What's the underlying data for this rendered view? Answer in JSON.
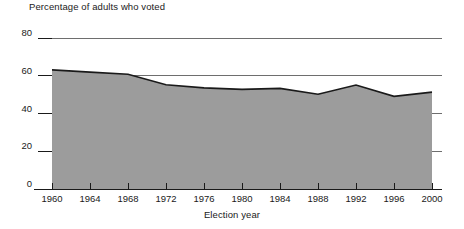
{
  "chart_data": {
    "type": "area",
    "title": "Percentage of adults who voted",
    "xlabel": "Election year",
    "ylabel": "",
    "x": [
      1960,
      1964,
      1968,
      1972,
      1976,
      1980,
      1984,
      1988,
      1992,
      1996,
      2000
    ],
    "values": [
      63.1,
      61.9,
      60.8,
      55.2,
      53.6,
      52.8,
      53.3,
      50.2,
      55.1,
      49.1,
      51.3
    ],
    "categories": [
      "1960",
      "1964",
      "1968",
      "1972",
      "1976",
      "1980",
      "1984",
      "1988",
      "1992",
      "1996",
      "2000"
    ],
    "xtick_labels": [
      "1960",
      "1964",
      "1968",
      "1972",
      "1976",
      "1980",
      "1984",
      "1988",
      "1992",
      "1996",
      "2000"
    ],
    "ytick_labels": [
      "0",
      "20",
      "40",
      "60",
      "80"
    ],
    "yticks": [
      0,
      20,
      40,
      60,
      80
    ],
    "ylim": [
      0,
      80
    ],
    "xlim": [
      1960,
      2000
    ],
    "grid": true,
    "legend": false,
    "series_name": "Percentage of adults who voted",
    "area_color": "#9c9c9c",
    "line_color": "#1a1a1a",
    "axis_color": "#1a1a1a",
    "grid_color": "#6e6e6e"
  }
}
